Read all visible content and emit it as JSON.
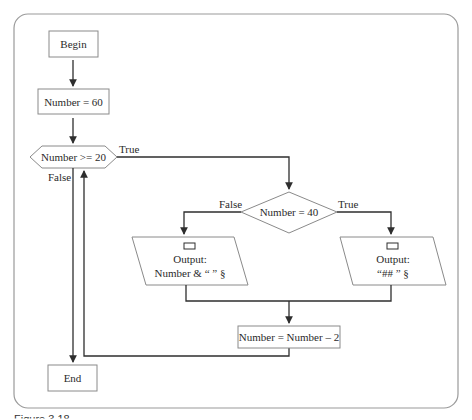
{
  "figure": {
    "type": "flowchart",
    "caption_partial": "Figure 3.18"
  },
  "nodes": {
    "begin": {
      "shape": "terminator",
      "label": "Begin"
    },
    "init": {
      "shape": "process",
      "label": "Number = 60"
    },
    "loop_check": {
      "shape": "preparation-hexagon",
      "label": "Number >= 20"
    },
    "check40": {
      "shape": "decision",
      "label": "Number = 40"
    },
    "output_false": {
      "shape": "output",
      "line1": "Output:",
      "line2": "Number & “ ” §"
    },
    "output_true": {
      "shape": "output",
      "line1": "Output:",
      "line2": "“## ” §"
    },
    "decrement": {
      "shape": "process",
      "label": "Number = Number – 2"
    },
    "end": {
      "shape": "terminator",
      "label": "End"
    }
  },
  "edge_labels": {
    "loop_true": "True",
    "loop_false": "False",
    "check40_false": "False",
    "check40_true": "True"
  },
  "edges": [
    {
      "from": "begin",
      "to": "init"
    },
    {
      "from": "init",
      "to": "loop_check"
    },
    {
      "from": "loop_check",
      "to": "check40",
      "label": "True"
    },
    {
      "from": "loop_check",
      "to": "end",
      "label": "False"
    },
    {
      "from": "check40",
      "to": "output_false",
      "label": "False"
    },
    {
      "from": "check40",
      "to": "output_true",
      "label": "True"
    },
    {
      "from": "output_false",
      "to": "decrement"
    },
    {
      "from": "output_true",
      "to": "decrement"
    },
    {
      "from": "decrement",
      "to": "loop_check"
    }
  ],
  "colors": {
    "line": "#2e2e2e",
    "shape_border": "#8a8a8a",
    "frame": "#9a9a9a",
    "text": "#2a2a2a",
    "background": "#ffffff"
  }
}
